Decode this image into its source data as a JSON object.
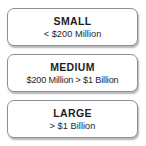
{
  "diagram": {
    "name": "company-size-tiers",
    "type": "stacked-label-boxes",
    "background_color": "#ffffff",
    "box_border_color": "#8d9096",
    "box_fill_color": "#ffffff",
    "title_text_color": "#1d1d1f",
    "range_text_color": "#26262a",
    "tiers": [
      {
        "id": "small",
        "title": "SMALL",
        "range": "< $200 Million"
      },
      {
        "id": "medium",
        "title": "MEDIUM",
        "range": "$200 Million > $1 Billion"
      },
      {
        "id": "large",
        "title": "LARGE",
        "range": "> $1 Billion"
      }
    ]
  }
}
